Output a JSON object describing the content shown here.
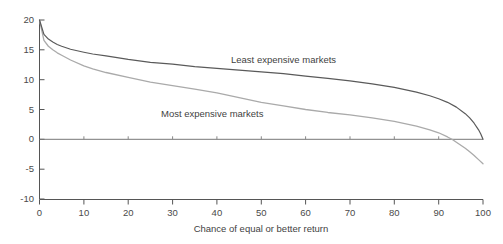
{
  "chart_data": {
    "type": "line",
    "title": "",
    "subtitle": "",
    "xlabel": "Chance of equal or better return",
    "ylabel": "",
    "xlim": [
      0,
      100
    ],
    "ylim": [
      -10,
      20
    ],
    "xticks": [
      0,
      10,
      20,
      30,
      40,
      50,
      60,
      70,
      80,
      90,
      100
    ],
    "yticks": [
      20,
      15,
      10,
      5,
      0,
      -5,
      -10
    ],
    "xtick_labels": [
      "0",
      "10",
      "20",
      "30",
      "40",
      "50",
      "60",
      "70",
      "80",
      "90",
      "100"
    ],
    "ytick_labels": [
      "20",
      "15",
      "10",
      "5",
      "0",
      "-5",
      "-10"
    ],
    "grid": false,
    "legend_position": "inline-annotations",
    "zero_line": true,
    "series": [
      {
        "name": "Least expensive markets",
        "color": "#5a5a5a",
        "label_position": {
          "x": 46,
          "y": 13.4
        },
        "x": [
          0,
          1,
          2,
          3,
          4,
          5,
          7,
          10,
          12,
          15,
          20,
          25,
          30,
          35,
          40,
          45,
          50,
          55,
          60,
          65,
          70,
          75,
          80,
          85,
          88,
          90,
          92,
          94,
          96,
          97,
          98,
          99,
          99.5,
          100
        ],
        "values": [
          20.0,
          17.6,
          16.8,
          16.3,
          15.9,
          15.6,
          15.1,
          14.6,
          14.3,
          14.0,
          13.4,
          12.9,
          12.6,
          12.2,
          11.9,
          11.6,
          11.3,
          11.0,
          10.6,
          10.2,
          9.8,
          9.3,
          8.7,
          7.9,
          7.3,
          6.8,
          6.2,
          5.4,
          4.3,
          3.6,
          2.7,
          1.6,
          0.9,
          0.0
        ]
      },
      {
        "name": "Most expensive markets",
        "color": "#aaaaaa",
        "label_position": {
          "x": 29,
          "y": 4.6
        },
        "x": [
          0,
          1,
          2,
          3,
          4,
          5,
          7,
          10,
          12,
          15,
          20,
          25,
          30,
          35,
          40,
          45,
          50,
          55,
          60,
          65,
          70,
          75,
          80,
          85,
          88,
          90,
          92,
          93,
          94,
          96,
          97,
          98,
          99,
          100
        ],
        "values": [
          20.0,
          16.6,
          15.6,
          15.0,
          14.5,
          14.1,
          13.3,
          12.3,
          11.8,
          11.2,
          10.4,
          9.6,
          9.0,
          8.4,
          7.8,
          7.0,
          6.2,
          5.6,
          5.0,
          4.5,
          4.1,
          3.6,
          3.0,
          2.2,
          1.6,
          1.1,
          0.4,
          0.0,
          -0.5,
          -1.5,
          -2.1,
          -2.7,
          -3.4,
          -4.1
        ]
      }
    ]
  },
  "axes": {
    "x_axis_title": "Chance of equal or better return",
    "y_axis_title": ""
  }
}
